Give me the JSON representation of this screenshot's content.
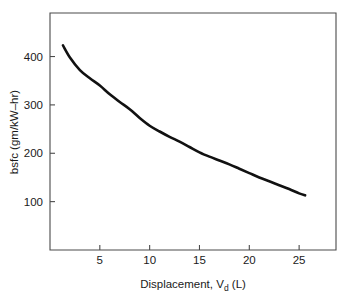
{
  "chart_data": {
    "type": "line",
    "title": "",
    "xlabel": "Displacement, V",
    "xlabel_sub": "d",
    "xlabel_unit": " (L)",
    "ylabel": "bsfc (gm/kW–hr)",
    "xlim": [
      0,
      28.7
    ],
    "ylim": [
      0,
      490
    ],
    "grid": false,
    "legend": false,
    "xticks": [
      5,
      10,
      15,
      20,
      25
    ],
    "xtick_labels": [
      "5",
      "10",
      "15",
      "20",
      "25"
    ],
    "yticks": [
      100,
      200,
      300,
      400
    ],
    "ytick_labels": [
      "100",
      "200",
      "300",
      "400"
    ],
    "series": [
      {
        "name": "bsfc",
        "x": [
          1.3,
          2,
          3,
          4,
          5,
          6,
          7,
          8,
          9,
          10,
          11,
          12,
          13,
          14,
          15,
          16,
          17,
          18,
          19,
          20,
          21,
          22,
          23,
          24,
          25,
          25.6
        ],
        "values": [
          423,
          398,
          372,
          355,
          340,
          322,
          306,
          291,
          273,
          257,
          245,
          234,
          224,
          213,
          202,
          193,
          185,
          177,
          168,
          159,
          150,
          142,
          134,
          126,
          117,
          113
        ]
      }
    ],
    "line_color": "#111111",
    "axis_color": "#4a4a4a",
    "background_color": "#ffffff"
  }
}
